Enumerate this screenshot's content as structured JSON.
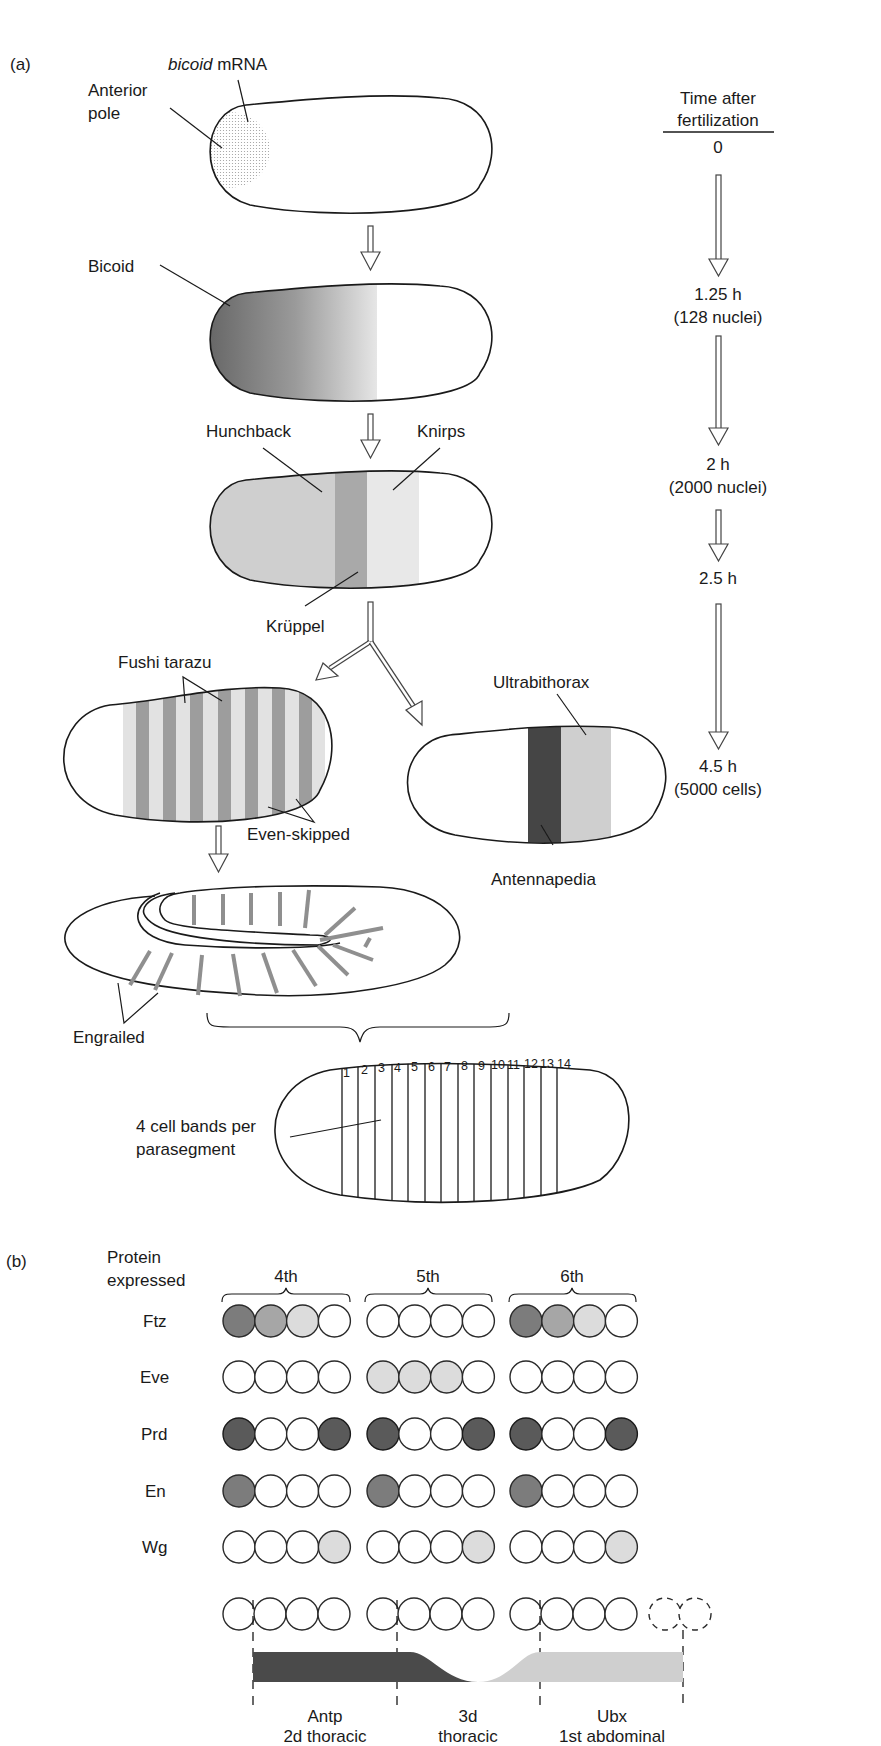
{
  "panel_a": {
    "label": "(a)",
    "timeline": {
      "title_line1": "Time after",
      "title_line2": "fertilization",
      "steps": [
        {
          "time": "0",
          "detail": ""
        },
        {
          "time": "1.25 h",
          "detail": "(128 nuclei)"
        },
        {
          "time": "2 h",
          "detail": "(2000 nuclei)"
        },
        {
          "time": "2.5 h",
          "detail": ""
        },
        {
          "time": "4.5 h",
          "detail": "(5000 cells)"
        }
      ]
    },
    "stage1": {
      "mrna_italic": "bicoid",
      "mrna_rest": " mRNA",
      "pole_line1": "Anterior",
      "pole_line2": "pole"
    },
    "stage2": {
      "protein": "Bicoid"
    },
    "stage3": {
      "left": "Hunchback",
      "right": "Knirps",
      "bottom": "Krüppel"
    },
    "stage4_left": {
      "top": "Fushi tarazu",
      "bottom": "Even-skipped",
      "stripe_count": 7
    },
    "stage4_right": {
      "top": "Ultrabithorax",
      "bottom": "Antennapedia"
    },
    "stage5": {
      "protein": "Engrailed"
    },
    "stage6": {
      "bands": [
        "1",
        "2",
        "3",
        "4",
        "5",
        "6",
        "7",
        "8",
        "9",
        "10",
        "11",
        "12",
        "13",
        "14"
      ],
      "note_line1": "4 cell bands per",
      "note_line2": "parasegment"
    }
  },
  "panel_b": {
    "label": "(b)",
    "row_header_line1": "Protein",
    "row_header_line2": "expressed",
    "parasegments": [
      "4th",
      "5th",
      "6th"
    ],
    "rows": [
      {
        "protein": "Ftz",
        "cells": [
          [
            "dark2",
            "mid",
            "light",
            "none"
          ],
          [
            "none",
            "none",
            "none",
            "none"
          ],
          [
            "dark2",
            "mid",
            "light",
            "none"
          ]
        ]
      },
      {
        "protein": "Eve",
        "cells": [
          [
            "none",
            "none",
            "none",
            "none"
          ],
          [
            "light",
            "light",
            "light",
            "none"
          ],
          [
            "none",
            "none",
            "none",
            "none"
          ]
        ]
      },
      {
        "protein": "Prd",
        "cells": [
          [
            "dark",
            "none",
            "none",
            "dark"
          ],
          [
            "dark",
            "none",
            "none",
            "dark"
          ],
          [
            "dark",
            "none",
            "none",
            "dark"
          ]
        ]
      },
      {
        "protein": "En",
        "cells": [
          [
            "dark2",
            "none",
            "none",
            "none"
          ],
          [
            "dark2",
            "none",
            "none",
            "none"
          ],
          [
            "dark2",
            "none",
            "none",
            "none"
          ]
        ]
      },
      {
        "protein": "Wg",
        "cells": [
          [
            "none",
            "none",
            "none",
            "light"
          ],
          [
            "none",
            "none",
            "none",
            "light"
          ],
          [
            "none",
            "none",
            "none",
            "light"
          ]
        ]
      }
    ],
    "domains": [
      {
        "gene": "Antp",
        "segment": "2d thoracic"
      },
      {
        "gene": "3d",
        "segment": "thoracic"
      },
      {
        "gene": "Ubx",
        "segment": "1st abdominal"
      }
    ],
    "colors": {
      "dark": "#5a5a5a",
      "dark2": "#7c7c7c",
      "mid": "#a6a6a6",
      "light": "#dcdcdc",
      "none": "#ffffff",
      "antp": "#4a4a4a",
      "ubx": "#cfcfcf"
    }
  }
}
